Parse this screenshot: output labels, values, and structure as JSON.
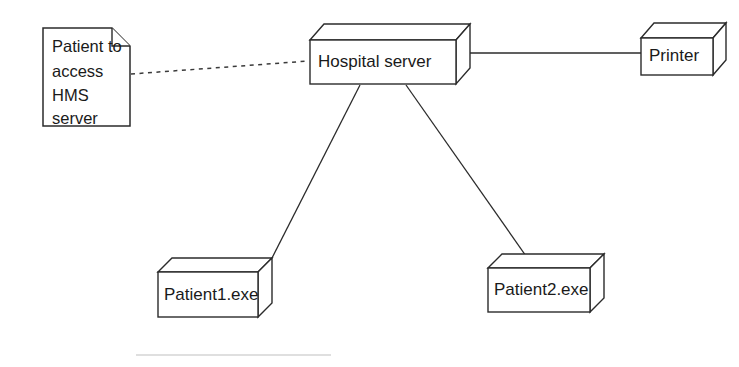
{
  "diagram": {
    "type": "uml-deployment-diagram",
    "background_color": "#ffffff",
    "line_color": "#2b2b2b",
    "text_color": "#1a1a1a"
  },
  "note": {
    "name": "patient-access-note",
    "lines": [
      "Patient to",
      "access",
      "HMS",
      "server"
    ],
    "line1": "Patient to",
    "line2": "access",
    "line3": "HMS",
    "line4": "server"
  },
  "nodes": [
    {
      "id": "hospital-server",
      "label": "Hospital server"
    },
    {
      "id": "printer",
      "label": "Printer"
    },
    {
      "id": "patient1",
      "label": "Patient1.exe"
    },
    {
      "id": "patient2",
      "label": "Patient2.exe"
    }
  ],
  "labels": {
    "hospital_server": "Hospital server",
    "printer": "Printer",
    "patient1": "Patient1.exe",
    "patient2": "Patient2.exe"
  },
  "connections": [
    {
      "from": "patient-access-note",
      "to": "hospital-server",
      "style": "dashed"
    },
    {
      "from": "hospital-server",
      "to": "printer",
      "style": "solid"
    },
    {
      "from": "hospital-server",
      "to": "patient1",
      "style": "solid"
    },
    {
      "from": "hospital-server",
      "to": "patient2",
      "style": "solid"
    }
  ]
}
